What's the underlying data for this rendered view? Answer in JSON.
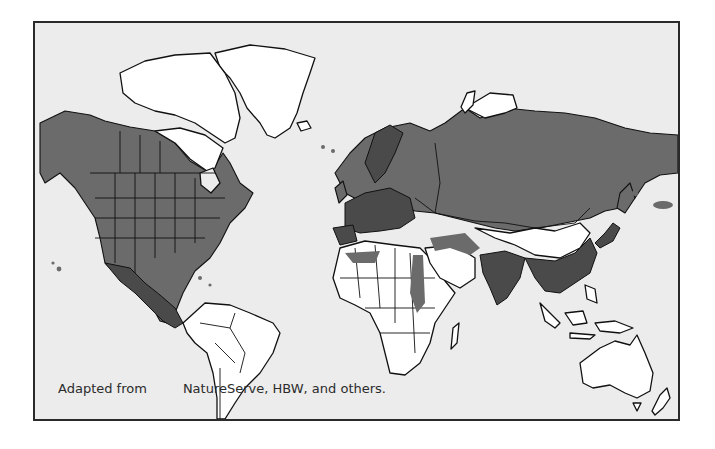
{
  "map": {
    "title": "",
    "legend": {
      "range_color": "#6b6b6b",
      "land_color": "#ffffff",
      "ocean_color": "#ececec"
    },
    "regions_shaded": [
      "North America (Alaska, Canada, USA, Mexico)",
      "Europe",
      "Russia / Northern Asia",
      "Middle East",
      "South Asia (India)",
      "Southeast Asia",
      "China (east)",
      "Japan",
      "North Africa (patches)"
    ],
    "caption": {
      "prefix": "Adapted from",
      "suffix": "NatureServe, HBW, and others."
    }
  }
}
